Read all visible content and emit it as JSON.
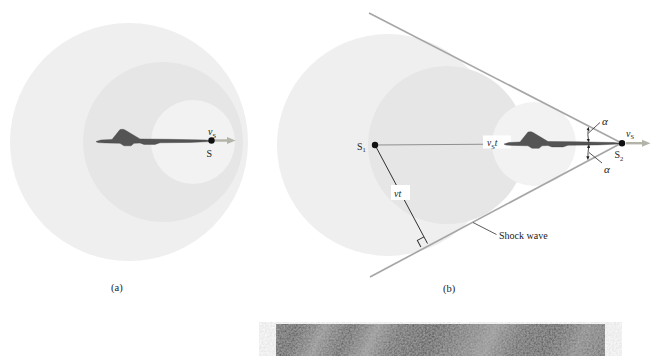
{
  "figure": {
    "panel_a": {
      "caption": "(a)",
      "velocity_label": {
        "base": "v",
        "sub": "S"
      },
      "source_label": "S"
    },
    "panel_b": {
      "caption": "(b)",
      "source1_label": {
        "base": "S",
        "sub": "1"
      },
      "source2_label": {
        "base": "S",
        "sub": "2"
      },
      "velocity_label": {
        "base": "v",
        "sub": "S"
      },
      "distance_label": {
        "base": "v",
        "sub": "S",
        "suffix": "t"
      },
      "radius_label": "vt",
      "angle_label_top": "α",
      "angle_label_bottom": "α",
      "shock_wave_label": "Shock wave"
    },
    "colors": {
      "wavefront_outer": "#efefef",
      "wavefront_middle": "#e6e6e6",
      "wavefront_inner": "#f2f2f2",
      "shock_line": "#a6a6a6",
      "aircraft": "#545454",
      "velocity_arrow": "#b3b3aa",
      "text": "#1a1a1a"
    }
  }
}
